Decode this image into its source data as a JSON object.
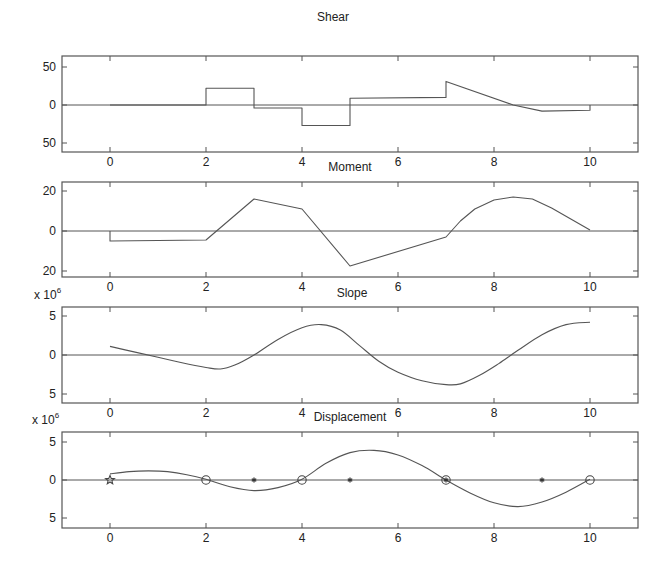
{
  "chart_data": [
    {
      "type": "line",
      "title": "Shear",
      "xlabel": "",
      "ylabel": "",
      "exponent_label": "",
      "xlim": [
        -1,
        11
      ],
      "ylim": [
        -60,
        60
      ],
      "xticks": [
        0,
        2,
        4,
        6,
        8,
        10
      ],
      "xtick_labels": [
        "0",
        "2",
        "4",
        "6",
        "8",
        "10"
      ],
      "yticks": [
        50,
        0,
        -50
      ],
      "ytick_labels": [
        "50",
        "0",
        "50"
      ],
      "grid": false,
      "zero_line": true,
      "series": [
        {
          "name": "Shear",
          "x": [
            0,
            2,
            2,
            3,
            3,
            4,
            4,
            5,
            5,
            7,
            7,
            8.4,
            9,
            10,
            10
          ],
          "y": [
            0,
            0,
            22,
            22,
            -4,
            -4,
            -27,
            -27,
            9,
            10,
            31,
            0,
            -8,
            -7,
            0
          ]
        }
      ],
      "frame_px": {
        "left": 62,
        "right": 638,
        "top": 56,
        "bottom": 152,
        "y_top_px": 67,
        "y_zero_px": 105,
        "y_bot_px": 145
      }
    },
    {
      "type": "line",
      "title": "Moment",
      "xlabel": "",
      "ylabel": "",
      "exponent_label": "",
      "xlim": [
        -1,
        11
      ],
      "ylim": [
        -24,
        24
      ],
      "xticks": [
        0,
        2,
        4,
        6,
        8,
        10
      ],
      "xtick_labels": [
        "0",
        "2",
        "4",
        "6",
        "8",
        "10"
      ],
      "yticks": [
        20,
        0,
        -20
      ],
      "ytick_labels": [
        "20",
        "0",
        "20"
      ],
      "grid": false,
      "zero_line": true,
      "series": [
        {
          "name": "Moment",
          "x": [
            0,
            0,
            2,
            3,
            4,
            5,
            7,
            7.3,
            7.6,
            8.0,
            8.4,
            8.8,
            9.2,
            9.6,
            10
          ],
          "y": [
            0,
            -5,
            -4.5,
            16,
            11,
            -17.5,
            -3,
            5,
            11,
            15.5,
            17,
            16,
            11.5,
            6,
            0.5
          ]
        }
      ],
      "frame_px": {
        "left": 62,
        "right": 638,
        "top": 182,
        "bottom": 277,
        "y_top_px": 191,
        "y_zero_px": 231,
        "y_bot_px": 270
      }
    },
    {
      "type": "line",
      "title": "Slope",
      "xlabel": "",
      "ylabel": "",
      "exponent_label": "x 10^6",
      "exponent_base": "x 10",
      "exponent_power": "6",
      "xlim": [
        -1,
        11
      ],
      "ylim": [
        -6,
        6
      ],
      "xticks": [
        0,
        2,
        4,
        6,
        8,
        10
      ],
      "xtick_labels": [
        "0",
        "2",
        "4",
        "6",
        "8",
        "10"
      ],
      "yticks": [
        5,
        0,
        -5
      ],
      "ytick_labels": [
        "5",
        "0",
        "5"
      ],
      "grid": false,
      "zero_line": true,
      "series": [
        {
          "name": "Slope",
          "x": [
            0,
            0.5,
            1,
            1.5,
            2,
            2.3,
            2.6,
            3,
            3.5,
            4,
            4.4,
            4.8,
            5.2,
            5.6,
            6,
            6.5,
            7,
            7.3,
            7.7,
            8.1,
            8.5,
            9,
            9.5,
            10
          ],
          "y": [
            1.1,
            0.4,
            -0.3,
            -1.0,
            -1.6,
            -1.8,
            -1.3,
            0,
            2.0,
            3.5,
            3.9,
            3.2,
            1.2,
            -0.8,
            -2.2,
            -3.3,
            -3.8,
            -3.7,
            -2.6,
            -1.1,
            0.6,
            2.6,
            3.9,
            4.2
          ]
        }
      ],
      "frame_px": {
        "left": 62,
        "right": 638,
        "top": 307,
        "bottom": 403,
        "y_top_px": 316,
        "y_zero_px": 355,
        "y_bot_px": 395
      }
    },
    {
      "type": "line",
      "title": "Displacement",
      "xlabel": "",
      "ylabel": "",
      "exponent_label": "x 10^6",
      "exponent_base": "x 10",
      "exponent_power": "6",
      "xlim": [
        -1,
        11
      ],
      "ylim": [
        -6,
        6
      ],
      "xticks": [
        0,
        2,
        4,
        6,
        8,
        10
      ],
      "xtick_labels": [
        "0",
        "2",
        "4",
        "6",
        "8",
        "10"
      ],
      "yticks": [
        5,
        0,
        -5
      ],
      "ytick_labels": [
        "5",
        "0",
        "5"
      ],
      "grid": false,
      "zero_line": true,
      "series": [
        {
          "name": "Displacement",
          "x": [
            0,
            0.4,
            0.8,
            1.2,
            1.6,
            2,
            2.5,
            3,
            3.5,
            4,
            4.5,
            5,
            5.5,
            6,
            6.5,
            7,
            7.5,
            8,
            8.5,
            9,
            9.5,
            10
          ],
          "y": [
            0.8,
            1.1,
            1.2,
            1.1,
            0.7,
            0.1,
            -0.9,
            -1.4,
            -1.0,
            0.1,
            2.2,
            3.6,
            3.9,
            3.3,
            1.9,
            0.0,
            -1.7,
            -3.0,
            -3.5,
            -2.9,
            -1.6,
            0.1
          ]
        }
      ],
      "markers": [
        {
          "x": 0,
          "y": 0,
          "symbol": "star"
        },
        {
          "x": 2,
          "y": 0,
          "symbol": "circle"
        },
        {
          "x": 3,
          "y": 0,
          "symbol": "asterisk"
        },
        {
          "x": 4,
          "y": 0,
          "symbol": "circle"
        },
        {
          "x": 5,
          "y": 0,
          "symbol": "asterisk"
        },
        {
          "x": 7,
          "y": 0,
          "symbol": "circle-asterisk"
        },
        {
          "x": 9,
          "y": 0,
          "symbol": "asterisk"
        },
        {
          "x": 10,
          "y": 0,
          "symbol": "circle"
        }
      ],
      "frame_px": {
        "left": 62,
        "right": 638,
        "top": 432,
        "bottom": 528,
        "y_top_px": 442,
        "y_zero_px": 480,
        "y_bot_px": 520
      }
    }
  ],
  "layout": {
    "title_positions": [
      {
        "x": 333,
        "y": 21
      },
      {
        "x": 350,
        "y": 171
      },
      {
        "x": 352,
        "y": 297
      },
      {
        "x": 350,
        "y": 421
      }
    ],
    "xtick_label_offset": 14,
    "exponent_label_pos": [
      null,
      null,
      {
        "x": 42,
        "y": 299
      },
      {
        "x": 40,
        "y": 424
      }
    ]
  }
}
